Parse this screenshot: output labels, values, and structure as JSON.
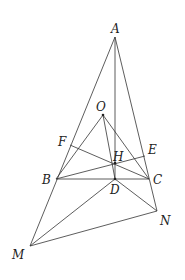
{
  "diagram": {
    "type": "geometry",
    "stroke_color": "#333333",
    "points": {
      "A": {
        "x": 115,
        "y": 37,
        "label": "A",
        "lx": 111,
        "ly": 33
      },
      "O": {
        "x": 103,
        "y": 115,
        "label": "O",
        "lx": 96,
        "ly": 111
      },
      "F": {
        "x": 70,
        "y": 145,
        "label": "F",
        "lx": 58,
        "ly": 146
      },
      "H": {
        "x": 115,
        "y": 163,
        "label": "H",
        "lx": 113,
        "ly": 161
      },
      "E": {
        "x": 145,
        "y": 156,
        "label": "E",
        "lx": 148,
        "ly": 154
      },
      "B": {
        "x": 56,
        "y": 179,
        "label": "B",
        "lx": 42,
        "ly": 184
      },
      "D": {
        "x": 115,
        "y": 179,
        "label": "D",
        "lx": 110,
        "ly": 194
      },
      "C": {
        "x": 149,
        "y": 179,
        "label": "C",
        "lx": 153,
        "ly": 184
      },
      "N": {
        "x": 157,
        "y": 211,
        "label": "N",
        "lx": 160,
        "ly": 225
      },
      "M": {
        "x": 30,
        "y": 246,
        "label": "M",
        "lx": 12,
        "ly": 259
      }
    },
    "segments": [
      [
        "A",
        "M"
      ],
      [
        "A",
        "N"
      ],
      [
        "A",
        "D"
      ],
      [
        "B",
        "C"
      ],
      [
        "O",
        "B"
      ],
      [
        "O",
        "D"
      ],
      [
        "O",
        "C"
      ],
      [
        "F",
        "C"
      ],
      [
        "B",
        "E"
      ],
      [
        "M",
        "D"
      ],
      [
        "M",
        "N"
      ],
      [
        "N",
        "D"
      ]
    ]
  }
}
